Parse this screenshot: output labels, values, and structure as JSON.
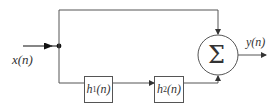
{
  "diagram": {
    "input": {
      "label": "x(n)"
    },
    "output": {
      "label": "y(n)"
    },
    "blocks": [
      {
        "id": "h1",
        "name": "h",
        "subscript": "1",
        "arg": "(n)"
      },
      {
        "id": "h2",
        "name": "h",
        "subscript": "2",
        "arg": "(n)"
      }
    ],
    "summer": {
      "symbol": "Σ"
    },
    "colors": {
      "line": "#555555",
      "text": "#333333",
      "background": "#ffffff"
    }
  }
}
